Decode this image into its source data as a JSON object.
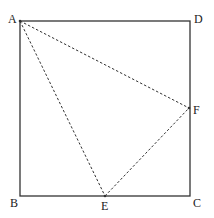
{
  "diagram": {
    "type": "geometry",
    "colors": {
      "stroke": "#333333",
      "background": "#ffffff"
    },
    "points": {
      "A": {
        "label": "A",
        "x": 20,
        "y": 21
      },
      "B": {
        "label": "B",
        "x": 20,
        "y": 196
      },
      "C": {
        "label": "C",
        "x": 190,
        "y": 196
      },
      "D": {
        "label": "D",
        "x": 190,
        "y": 21
      },
      "E": {
        "label": "E",
        "x": 105,
        "y": 196
      },
      "F": {
        "label": "F",
        "x": 189,
        "y": 108
      }
    },
    "solid_segments": [
      "AB",
      "BC",
      "CD",
      "DA"
    ],
    "dashed_segments": [
      "AE",
      "AF",
      "EF"
    ]
  }
}
